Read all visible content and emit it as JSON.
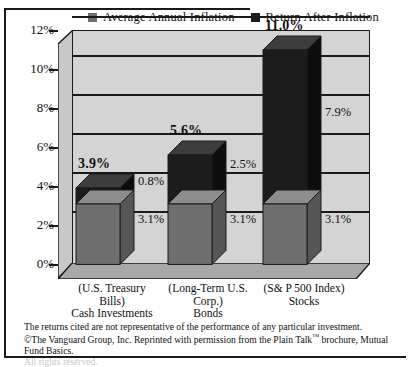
{
  "legend": {
    "items": [
      {
        "label": "Average Annual Inflation",
        "color": "#6e6e6e",
        "icon": "square-swatch-icon"
      },
      {
        "label": "Return After Inflation",
        "color": "#1c1c1c",
        "icon": "square-swatch-icon"
      }
    ]
  },
  "chart_data": {
    "type": "bar",
    "subtype": "stacked-3d-column",
    "title": "",
    "xlabel": "",
    "ylabel": "",
    "ylim": [
      0,
      12
    ],
    "ytick_labels": [
      "0%",
      "2%",
      "4%",
      "6%",
      "8%",
      "10%",
      "12%"
    ],
    "ytick_values": [
      0,
      2,
      4,
      6,
      8,
      10,
      12
    ],
    "grid": true,
    "legend_position": "top",
    "categories": [
      {
        "paren": "(U.S. Treasury",
        "paren2": "Bills)",
        "name": "Cash Investments"
      },
      {
        "paren": "(Long-Term U.S.",
        "paren2": "Corp.)",
        "name": "Bonds"
      },
      {
        "paren": "(S& P 500 Index)",
        "paren2": "",
        "name": "Stocks"
      }
    ],
    "category_labels": [
      "Cash Investments",
      "Bonds",
      "Stocks"
    ],
    "series": [
      {
        "name": "Average Annual Inflation",
        "color": "#6e6e6e",
        "values": [
          3.1,
          3.1,
          3.1
        ]
      },
      {
        "name": "Return After Inflation",
        "color": "#1c1c1c",
        "values": [
          0.8,
          2.5,
          7.9
        ]
      }
    ],
    "totals": [
      3.9,
      5.6,
      11.0
    ],
    "total_labels": [
      "3.9%",
      "5.6%",
      "11.0%"
    ],
    "inflation_labels": [
      "3.1%",
      "3.1%",
      "3.1%"
    ],
    "return_labels": [
      "0.8%",
      "2.5%",
      "7.9%"
    ]
  },
  "footnote": {
    "line1": "The returns cited are not representative of the performance of any particular investment.",
    "line2_pre": "©The Vanguard Group, Inc. Reprinted with permission from the Plain Talk",
    "line2_tm": "™",
    "line2_post": " brochure, Mutual",
    "line3": "Fund Basics.",
    "line4": "All rights reserved."
  },
  "colors": {
    "inflation": "#6e6e6e",
    "inflation_top": "#8d8d8d",
    "inflation_side": "#565656",
    "return": "#1c1c1c",
    "return_top": "#3d3d3d",
    "return_side": "#0d0d0d",
    "wall": "#d4d4d4",
    "wall_side": "#c0c0c0",
    "floor": "#a8a8a8",
    "outline": "#1a1a1a",
    "background": "#ffffff"
  }
}
